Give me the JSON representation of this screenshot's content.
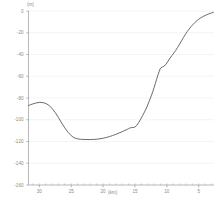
{
  "chart_data": {
    "type": "line",
    "title": "",
    "subtitle": "",
    "xlabel": "(km)",
    "ylabel": "(m)",
    "x_unit": "(km)",
    "y_unit": "(m)",
    "x_axis_reversed": true,
    "grid": "horizontal",
    "legend": "none",
    "xlim": [
      31.7,
      2.6
    ],
    "ylim": [
      -160,
      0
    ],
    "xticks": [
      30,
      25,
      20,
      15,
      10,
      5
    ],
    "xtick_labels": [
      "30",
      "25",
      "20",
      "15",
      "10",
      "5"
    ],
    "yticks": [
      0,
      -20,
      -40,
      -60,
      -80,
      -100,
      -120,
      -140,
      -160
    ],
    "ytick_labels": [
      "0",
      "-20",
      "-40",
      "-60",
      "-80",
      "-100",
      "-120",
      "-140",
      "-160"
    ],
    "x_minor_tick_interval": 1,
    "series": [
      {
        "name": "profile",
        "color": "#595959",
        "linewidth": 0.9,
        "x": [
          31.7,
          31.4,
          31.0,
          30.6,
          30.2,
          29.9,
          29.6,
          29.2,
          28.8,
          28.4,
          28.0,
          27.5,
          27.0,
          26.5,
          26.0,
          25.5,
          25.0,
          24.6,
          24.2,
          23.8,
          23.4,
          23.0,
          22.5,
          22.0,
          21.5,
          21.0,
          20.5,
          20.0,
          19.5,
          19.0,
          18.5,
          18.0,
          17.5,
          17.0,
          16.6,
          16.2,
          16.0,
          15.8,
          15.5,
          15.2,
          15.0,
          14.7,
          14.4,
          14.1,
          13.8,
          13.5,
          13.2,
          13.0,
          12.7,
          12.4,
          12.2,
          12.0,
          11.8,
          11.6,
          11.4,
          11.2,
          11.0,
          10.7,
          10.4,
          10.1,
          9.8,
          9.5,
          9.2,
          8.9,
          8.6,
          8.3,
          8.0,
          7.7,
          7.4,
          7.1,
          6.8,
          6.5,
          6.2,
          5.9,
          5.6,
          5.3,
          5.0,
          4.6,
          4.2,
          3.8,
          3.4,
          3.0,
          2.7
        ],
        "y": [
          -87.0,
          -86.2,
          -85.4,
          -84.7,
          -84.2,
          -84.0,
          -84.1,
          -84.6,
          -85.6,
          -87.2,
          -89.5,
          -93.5,
          -98.0,
          -103.0,
          -107.5,
          -111.5,
          -114.6,
          -116.4,
          -117.3,
          -117.8,
          -118.0,
          -118.1,
          -118.2,
          -118.2,
          -118.1,
          -117.9,
          -117.5,
          -117.0,
          -116.3,
          -115.5,
          -114.5,
          -113.4,
          -112.2,
          -111.0,
          -109.9,
          -108.8,
          -108.2,
          -107.6,
          -107.2,
          -107.0,
          -106.8,
          -105.0,
          -102.4,
          -99.4,
          -96.2,
          -92.8,
          -89.2,
          -86.4,
          -82.0,
          -77.4,
          -74.0,
          -70.4,
          -66.6,
          -62.8,
          -59.0,
          -55.6,
          -52.6,
          -51.4,
          -50.6,
          -48.8,
          -46.0,
          -43.4,
          -41.0,
          -38.6,
          -36.2,
          -33.4,
          -30.4,
          -27.4,
          -24.4,
          -21.6,
          -19.0,
          -16.6,
          -14.4,
          -12.4,
          -10.6,
          -9.0,
          -7.6,
          -6.0,
          -4.7,
          -3.6,
          -2.6,
          -1.8,
          -1.3
        ]
      }
    ]
  },
  "axes": {
    "y_unit_label": "(m)",
    "x_unit_label": "(km)"
  }
}
